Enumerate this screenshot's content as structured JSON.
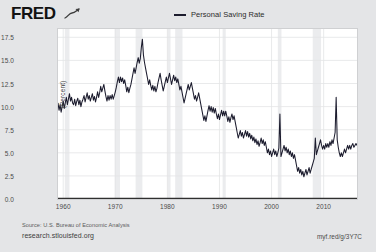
{
  "header": {
    "logo_text": "FRED",
    "logo_icon": "fred-squiggle-chart-icon",
    "legend": {
      "label": "Personal Saving Rate",
      "swatch_color": "#1c1c2e"
    }
  },
  "footer": {
    "source": "Source: U.S. Bureau of Economic Analysis",
    "site_url": "research.stlouisfed.org",
    "short_url": "myf.red/g/3Y7C"
  },
  "colors": {
    "page_background": "#e4e5e7",
    "plot_background": "#ffffff",
    "line": "#1c1c2e",
    "gridline": "#e3e4e6",
    "axis": "#2f2f2f",
    "recession_band": "#ebecee"
  },
  "chart_data": {
    "type": "line",
    "title": "",
    "xlabel": "",
    "ylabel": "(Percent)",
    "legend_position": "top-center",
    "grid": true,
    "xlim": [
      1959.0,
      2016.4
    ],
    "ylim": [
      0.0,
      18.4
    ],
    "ytick_labels": [
      "0.0",
      "2.5",
      "5.0",
      "7.5",
      "10.0",
      "12.5",
      "15.0",
      "17.5"
    ],
    "yticks": [
      0.0,
      2.5,
      5.0,
      7.5,
      10.0,
      12.5,
      15.0,
      17.5
    ],
    "xtick_labels": [
      "1960",
      "1970",
      "1980",
      "1990",
      "2000",
      "2010"
    ],
    "xticks": [
      1960,
      1970,
      1980,
      1990,
      2000,
      2010
    ],
    "recession_bands": [
      [
        1960.3,
        1961.2
      ],
      [
        1969.9,
        1970.9
      ],
      [
        1973.9,
        1975.2
      ],
      [
        1980.0,
        1980.6
      ],
      [
        1981.5,
        1982.9
      ],
      [
        1990.6,
        1991.2
      ],
      [
        2001.2,
        2001.9
      ],
      [
        2007.9,
        2009.5
      ]
    ],
    "series": [
      {
        "name": "Personal Saving Rate",
        "color": "#1c1c2e",
        "x": [
          1959.0,
          1959.2,
          1959.4,
          1959.6,
          1959.8,
          1960.0,
          1960.2,
          1960.4,
          1960.6,
          1960.8,
          1961.0,
          1961.2,
          1961.4,
          1961.6,
          1961.8,
          1962.0,
          1962.2,
          1962.4,
          1962.6,
          1962.8,
          1963.0,
          1963.2,
          1963.4,
          1963.6,
          1963.8,
          1964.0,
          1964.2,
          1964.4,
          1964.6,
          1964.8,
          1965.0,
          1965.2,
          1965.4,
          1965.6,
          1965.8,
          1966.0,
          1966.2,
          1966.4,
          1966.6,
          1966.8,
          1967.0,
          1967.2,
          1967.4,
          1967.6,
          1967.8,
          1968.0,
          1968.2,
          1968.4,
          1968.6,
          1968.8,
          1969.0,
          1969.2,
          1969.4,
          1969.6,
          1969.8,
          1970.0,
          1970.2,
          1970.4,
          1970.6,
          1970.8,
          1971.0,
          1971.2,
          1971.4,
          1971.6,
          1971.8,
          1972.0,
          1972.2,
          1972.4,
          1972.6,
          1972.8,
          1973.0,
          1973.2,
          1973.4,
          1973.6,
          1973.8,
          1974.0,
          1974.2,
          1974.4,
          1974.6,
          1974.8,
          1975.0,
          1975.2,
          1975.4,
          1975.6,
          1975.8,
          1976.0,
          1976.2,
          1976.4,
          1976.6,
          1976.8,
          1977.0,
          1977.2,
          1977.4,
          1977.6,
          1977.8,
          1978.0,
          1978.2,
          1978.4,
          1978.6,
          1978.8,
          1979.0,
          1979.2,
          1979.4,
          1979.6,
          1979.8,
          1980.0,
          1980.2,
          1980.4,
          1980.6,
          1980.8,
          1981.0,
          1981.2,
          1981.4,
          1981.6,
          1981.8,
          1982.0,
          1982.2,
          1982.4,
          1982.6,
          1982.8,
          1983.0,
          1983.2,
          1983.4,
          1983.6,
          1983.8,
          1984.0,
          1984.2,
          1984.4,
          1984.6,
          1984.8,
          1985.0,
          1985.2,
          1985.4,
          1985.6,
          1985.8,
          1986.0,
          1986.2,
          1986.4,
          1986.6,
          1986.8,
          1987.0,
          1987.2,
          1987.4,
          1987.6,
          1987.8,
          1988.0,
          1988.2,
          1988.4,
          1988.6,
          1988.8,
          1989.0,
          1989.2,
          1989.4,
          1989.6,
          1989.8,
          1990.0,
          1990.2,
          1990.4,
          1990.6,
          1990.8,
          1991.0,
          1991.2,
          1991.4,
          1991.6,
          1991.8,
          1992.0,
          1992.2,
          1992.4,
          1992.6,
          1992.8,
          1993.0,
          1993.2,
          1993.4,
          1993.6,
          1993.8,
          1994.0,
          1994.2,
          1994.4,
          1994.6,
          1994.8,
          1995.0,
          1995.2,
          1995.4,
          1995.6,
          1995.8,
          1996.0,
          1996.2,
          1996.4,
          1996.6,
          1996.8,
          1997.0,
          1997.2,
          1997.4,
          1997.6,
          1997.8,
          1998.0,
          1998.2,
          1998.4,
          1998.6,
          1998.8,
          1999.0,
          1999.2,
          1999.4,
          1999.6,
          1999.8,
          2000.0,
          2000.2,
          2000.4,
          2000.6,
          2000.8,
          2001.0,
          2001.2,
          2001.4,
          2001.6,
          2001.8,
          2002.0,
          2002.2,
          2002.4,
          2002.6,
          2002.8,
          2003.0,
          2003.2,
          2003.4,
          2003.6,
          2003.8,
          2004.0,
          2004.2,
          2004.4,
          2004.6,
          2004.8,
          2005.0,
          2005.2,
          2005.4,
          2005.6,
          2005.8,
          2006.0,
          2006.2,
          2006.4,
          2006.6,
          2006.8,
          2007.0,
          2007.2,
          2007.4,
          2007.6,
          2007.8,
          2008.0,
          2008.2,
          2008.4,
          2008.6,
          2008.8,
          2009.0,
          2009.2,
          2009.4,
          2009.6,
          2009.8,
          2010.0,
          2010.2,
          2010.4,
          2010.6,
          2010.8,
          2011.0,
          2011.2,
          2011.4,
          2011.6,
          2011.8,
          2012.0,
          2012.2,
          2012.4,
          2012.6,
          2012.8,
          2013.0,
          2013.2,
          2013.4,
          2013.6,
          2013.8,
          2014.0,
          2014.2,
          2014.4,
          2014.6,
          2014.8,
          2015.0,
          2015.2,
          2015.4,
          2015.6,
          2015.8,
          2016.0,
          2016.2,
          2016.4
        ],
        "y": [
          10.4,
          9.6,
          10.2,
          9.4,
          10.0,
          10.6,
          9.8,
          10.4,
          11.0,
          10.2,
          10.8,
          11.4,
          10.6,
          11.0,
          10.4,
          10.2,
          10.8,
          10.1,
          10.6,
          10.9,
          10.2,
          10.7,
          10.0,
          10.5,
          10.8,
          11.2,
          10.5,
          11.0,
          11.5,
          10.8,
          11.2,
          10.6,
          11.0,
          11.4,
          10.7,
          11.1,
          10.5,
          11.0,
          11.6,
          11.0,
          11.5,
          12.2,
          11.6,
          12.0,
          12.4,
          11.7,
          11.1,
          10.6,
          11.2,
          10.7,
          11.2,
          10.8,
          11.3,
          10.8,
          11.2,
          11.6,
          12.1,
          12.7,
          13.2,
          12.6,
          13.2,
          12.7,
          13.1,
          12.5,
          12.9,
          12.3,
          11.6,
          12.1,
          11.5,
          12.0,
          12.4,
          13.0,
          13.6,
          14.2,
          13.6,
          14.2,
          14.8,
          15.3,
          14.7,
          15.2,
          16.4,
          17.3,
          15.6,
          14.8,
          14.2,
          13.6,
          13.0,
          12.4,
          12.9,
          12.3,
          11.8,
          12.3,
          11.7,
          12.2,
          11.6,
          12.0,
          12.6,
          13.1,
          13.6,
          12.9,
          12.3,
          11.7,
          12.2,
          12.7,
          13.2,
          12.6,
          13.1,
          13.6,
          13.0,
          12.4,
          12.9,
          13.4,
          12.8,
          13.2,
          12.6,
          13.0,
          12.4,
          11.8,
          12.2,
          11.6,
          11.0,
          10.4,
          10.9,
          11.4,
          11.9,
          12.4,
          11.8,
          12.2,
          12.6,
          12.0,
          11.4,
          10.8,
          11.2,
          10.6,
          11.0,
          11.5,
          10.9,
          10.3,
          9.7,
          9.1,
          8.5,
          9.0,
          8.4,
          9.0,
          9.6,
          10.1,
          9.5,
          10.0,
          9.4,
          9.9,
          9.3,
          9.8,
          9.2,
          8.7,
          9.2,
          8.6,
          9.1,
          9.6,
          9.0,
          9.5,
          9.0,
          9.5,
          9.0,
          8.4,
          8.9,
          8.3,
          8.8,
          9.2,
          8.6,
          9.0,
          8.4,
          7.8,
          7.2,
          6.6,
          7.0,
          7.4,
          6.8,
          7.2,
          6.6,
          7.0,
          7.4,
          6.8,
          7.3,
          6.7,
          7.1,
          6.5,
          6.9,
          6.3,
          6.7,
          6.1,
          6.5,
          5.9,
          6.3,
          5.7,
          6.1,
          6.6,
          6.0,
          6.4,
          5.8,
          6.2,
          5.6,
          5.0,
          5.4,
          4.8,
          5.2,
          4.6,
          5.0,
          5.4,
          4.8,
          5.2,
          4.6,
          5.0,
          5.5,
          9.2,
          4.6,
          5.0,
          5.4,
          5.8,
          5.2,
          5.6,
          5.0,
          5.4,
          4.8,
          5.2,
          4.6,
          5.0,
          4.4,
          4.8,
          4.2,
          3.6,
          3.0,
          3.4,
          2.8,
          3.2,
          2.6,
          3.0,
          2.4,
          2.8,
          3.2,
          2.6,
          3.0,
          3.4,
          2.8,
          3.2,
          3.6,
          4.0,
          4.4,
          6.6,
          4.8,
          5.2,
          5.6,
          6.0,
          6.4,
          5.8,
          5.4,
          5.8,
          5.4,
          6.0,
          5.6,
          6.0,
          5.6,
          6.2,
          5.8,
          6.4,
          6.0,
          6.6,
          7.2,
          11.0,
          6.4,
          5.6,
          5.0,
          4.6,
          5.0,
          4.6,
          5.0,
          5.4,
          5.0,
          5.4,
          5.8,
          5.4,
          5.8,
          5.4,
          5.8,
          6.0,
          5.6,
          5.8,
          6.0,
          5.8
        ]
      }
    ]
  }
}
